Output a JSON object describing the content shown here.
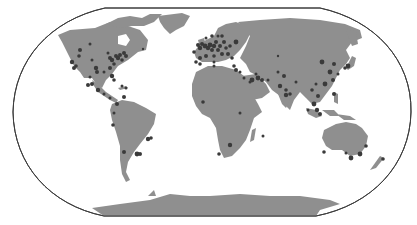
{
  "map": {
    "projection": "Robinson-like world map",
    "colors": {
      "background": "#ffffff",
      "land": "#8f8f8f",
      "frame": "#3c3c3c",
      "city_markers": "#3a3a3a"
    },
    "marker_description": "Dark circular markers at city locations, radius varies",
    "regions": [
      {
        "name": "north-america",
        "marker_count_approx": 35
      },
      {
        "name": "south-america",
        "marker_count_approx": 10
      },
      {
        "name": "europe",
        "marker_count_approx": 40
      },
      {
        "name": "africa",
        "marker_count_approx": 8
      },
      {
        "name": "middle-east",
        "marker_count_approx": 8
      },
      {
        "name": "asia",
        "marker_count_approx": 22
      },
      {
        "name": "oceania",
        "marker_count_approx": 7
      }
    ]
  }
}
